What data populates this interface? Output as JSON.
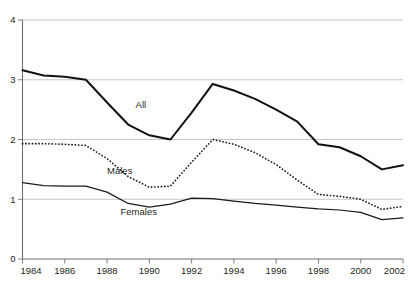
{
  "chart_data": {
    "type": "line",
    "title": "",
    "subtitle": "",
    "xlabel": "",
    "ylabel": "",
    "xlim": [
      1984,
      2002
    ],
    "ylim": [
      0,
      4
    ],
    "grid": true,
    "legend": "inline-labels",
    "x": [
      1984,
      1985,
      1986,
      1987,
      1988,
      1989,
      1990,
      1991,
      1992,
      1993,
      1994,
      1995,
      1996,
      1997,
      1998,
      1999,
      2000,
      2001,
      2002
    ],
    "xticks": [
      "1984",
      "1986",
      "1988",
      "1990",
      "1992",
      "1994",
      "1996",
      "1998",
      "2000",
      "2002"
    ],
    "xtick_values": [
      1984,
      1986,
      1988,
      1990,
      1992,
      1994,
      1996,
      1998,
      2000,
      2002
    ],
    "yticks": [
      "0",
      "1",
      "2",
      "3",
      "4"
    ],
    "ytick_values": [
      0,
      1,
      2,
      3,
      4
    ],
    "series": [
      {
        "name": "All",
        "style": "solid-thick",
        "label_x": 1989.6,
        "label_y": 2.52,
        "values": [
          3.16,
          3.07,
          3.05,
          3.0,
          2.62,
          2.25,
          2.07,
          2.0,
          2.45,
          2.93,
          2.82,
          2.68,
          2.5,
          2.3,
          1.92,
          1.87,
          1.72,
          1.5,
          1.57
        ]
      },
      {
        "name": "Males",
        "style": "dotted",
        "label_x": 1988.6,
        "label_y": 1.42,
        "values": [
          1.93,
          1.93,
          1.92,
          1.9,
          1.68,
          1.38,
          1.2,
          1.22,
          1.62,
          2.0,
          1.92,
          1.78,
          1.58,
          1.32,
          1.08,
          1.05,
          1.0,
          0.83,
          0.88
        ]
      },
      {
        "name": "Females",
        "style": "solid",
        "label_x": 1989.5,
        "label_y": 0.73,
        "values": [
          1.28,
          1.23,
          1.22,
          1.22,
          1.12,
          0.93,
          0.87,
          0.92,
          1.02,
          1.01,
          0.97,
          0.93,
          0.9,
          0.87,
          0.84,
          0.82,
          0.78,
          0.66,
          0.69
        ]
      }
    ]
  },
  "colors": {
    "line": "#1a1a1a",
    "grid": "#bfbfbf",
    "axis": "#6f6f6f",
    "text": "#231f20",
    "background": "#ffffff"
  },
  "caption": {
    "cropped_text": ""
  }
}
